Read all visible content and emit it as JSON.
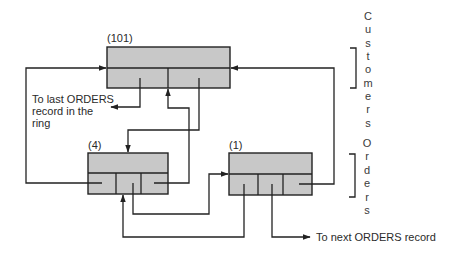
{
  "diagram": {
    "records": {
      "customer": {
        "label": "(101)"
      },
      "order_a": {
        "label": "(4)"
      },
      "order_b": {
        "label": "(1)"
      }
    },
    "annotations": {
      "last_orders": [
        "To last ORDERS",
        "record in the",
        "ring"
      ],
      "next_orders": "To next ORDERS record"
    },
    "group_labels": {
      "customers": [
        "C",
        "u",
        "s",
        "t",
        "o",
        "m",
        "e",
        "r",
        "s"
      ],
      "orders": [
        "O",
        "r",
        "d",
        "e",
        "r",
        "s"
      ]
    },
    "colors": {
      "record_fill": "#c8c8c8",
      "line": "#222222",
      "background": "#ffffff"
    }
  }
}
